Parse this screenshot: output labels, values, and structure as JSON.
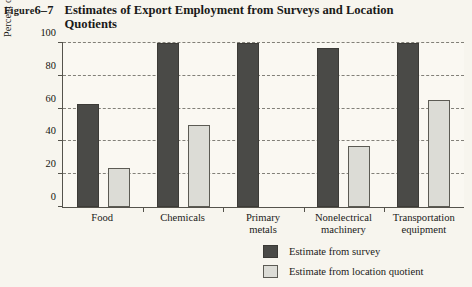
{
  "figure": {
    "label_prefix": "Figure",
    "label_number": "6–7",
    "title": "Estimates of Export Employment from Surveys and Location Quotients"
  },
  "axes": {
    "y_title_line1": "Percent of employment producing",
    "y_title_line2": "for export",
    "y_ticks": [
      "0",
      "20",
      "40",
      "60",
      "80",
      "100"
    ]
  },
  "legend": {
    "items": [
      {
        "label": "Estimate from survey",
        "color": "#4a4a47"
      },
      {
        "label": "Estimate from location quotient",
        "color": "#dcdcd6"
      }
    ]
  },
  "chart_data": {
    "type": "bar",
    "title": "Estimates of Export Employment from Surveys and Location Quotients",
    "xlabel": "",
    "ylabel": "Percent of employment producing for export",
    "ylim": [
      0,
      100
    ],
    "ytick_step": 20,
    "grid": true,
    "grid_style": "dashed-horizontal",
    "legend_position": "bottom-right",
    "categories": [
      "Food",
      "Chemicals",
      "Primary metals",
      "Nonelectrical machinery",
      "Transportation equipment"
    ],
    "category_lines": [
      [
        "Food"
      ],
      [
        "Chemicals"
      ],
      [
        "Primary",
        "metals"
      ],
      [
        "Nonelectrical",
        "machinery"
      ],
      [
        "Transportation",
        "equipment"
      ]
    ],
    "series": [
      {
        "name": "Estimate from survey",
        "color": "#4a4a47",
        "values": [
          63,
          100,
          100,
          97,
          100
        ]
      },
      {
        "name": "Estimate from location quotient",
        "color": "#dcdcd6",
        "values": [
          24,
          50,
          null,
          37,
          65
        ]
      }
    ]
  }
}
